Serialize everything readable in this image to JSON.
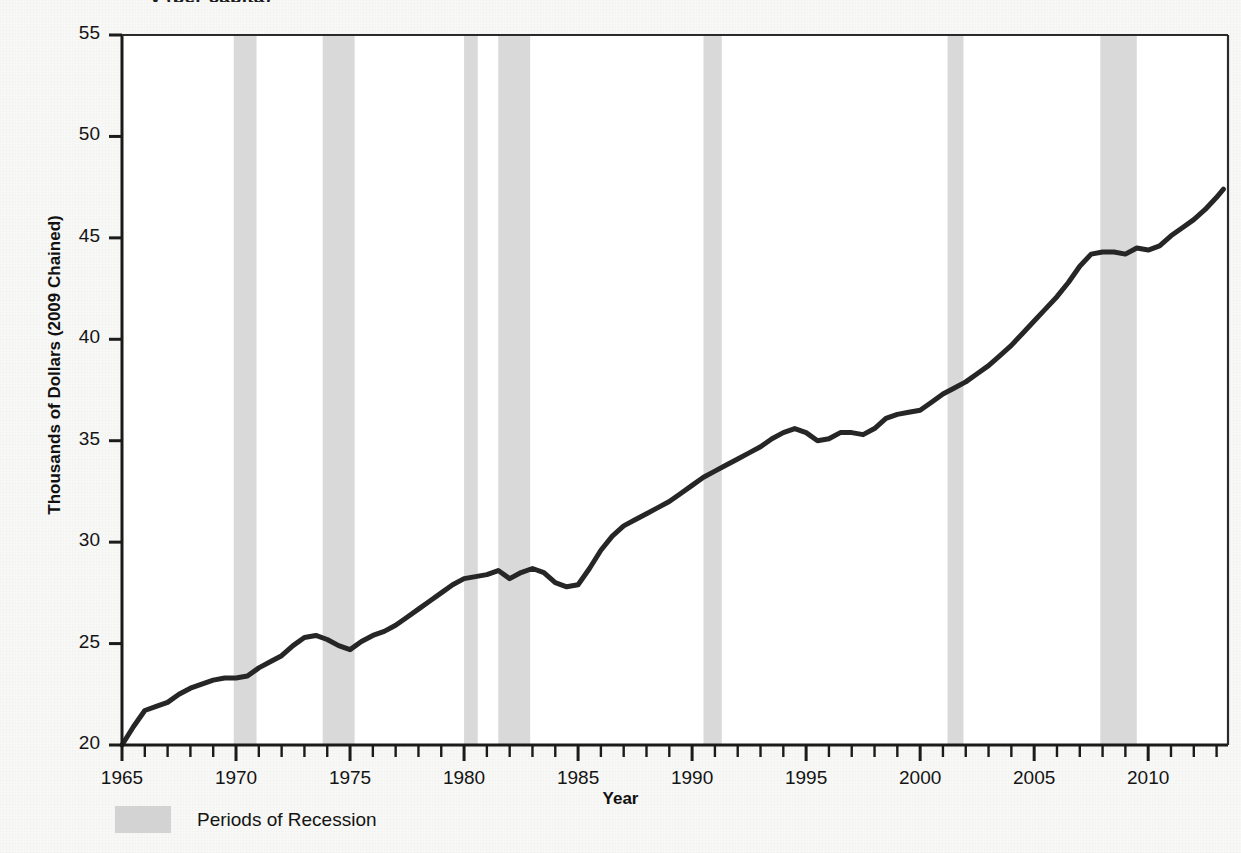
{
  "figure": {
    "title_partial": "y (per capita)",
    "background_color": "#f8f8f6",
    "plot_background_color": "#ffffff"
  },
  "axes": {
    "y_title": "Thousands of Dollars (2009 Chained)",
    "x_title": "Year",
    "y_ticks": [
      "20",
      "25",
      "30",
      "35",
      "40",
      "45",
      "50",
      "55"
    ],
    "x_ticks": [
      "1965",
      "1970",
      "1975",
      "1980",
      "1985",
      "1990",
      "1995",
      "2000",
      "2005",
      "2010"
    ]
  },
  "legend": {
    "swatch_color": "#d3d3d3",
    "label": "Periods of Recession"
  },
  "chart_data": {
    "type": "line",
    "xlabel": "Year",
    "ylabel": "Thousands of Dollars (2009 Chained)",
    "xlim": [
      1965,
      2013.5
    ],
    "ylim": [
      20,
      55
    ],
    "grid": false,
    "legend_position": "below-axis-left",
    "line_color": "#262626",
    "line_width_px": 5,
    "series": [
      {
        "name": "Real Disposable Income per Capita",
        "x": [
          1965.0,
          1965.5,
          1966.0,
          1966.5,
          1967.0,
          1967.5,
          1968.0,
          1968.5,
          1969.0,
          1969.5,
          1970.0,
          1970.5,
          1971.0,
          1971.5,
          1972.0,
          1972.5,
          1973.0,
          1973.5,
          1974.0,
          1974.5,
          1975.0,
          1975.5,
          1976.0,
          1976.5,
          1977.0,
          1977.5,
          1978.0,
          1978.5,
          1979.0,
          1979.5,
          1980.0,
          1980.5,
          1981.0,
          1981.5,
          1982.0,
          1982.5,
          1983.0,
          1983.5,
          1984.0,
          1984.5,
          1985.0,
          1985.5,
          1986.0,
          1986.5,
          1987.0,
          1987.5,
          1988.0,
          1988.5,
          1989.0,
          1989.5,
          1990.0,
          1990.5,
          1991.0,
          1991.5,
          1992.0,
          1992.5,
          1993.0,
          1993.5,
          1994.0,
          1994.5,
          1995.0,
          1995.5,
          1996.0,
          1996.5,
          1997.0,
          1997.5,
          1998.0,
          1998.5,
          1999.0,
          1999.5,
          2000.0,
          2000.5,
          2001.0,
          2001.5,
          2002.0,
          2002.5,
          2003.0,
          2003.5,
          2004.0,
          2004.5,
          2005.0,
          2005.5,
          2006.0,
          2006.5,
          2007.0,
          2007.5,
          2008.0,
          2008.5,
          2009.0,
          2009.5,
          2010.0,
          2010.5,
          2011.0,
          2011.5,
          2012.0,
          2012.5,
          2013.0,
          2013.3
        ],
        "y": [
          20.0,
          20.9,
          21.7,
          21.9,
          22.1,
          22.5,
          22.8,
          23.0,
          23.2,
          23.3,
          23.3,
          23.4,
          23.8,
          24.1,
          24.4,
          24.9,
          25.3,
          25.4,
          25.2,
          24.9,
          24.7,
          25.1,
          25.4,
          25.6,
          25.9,
          26.3,
          26.7,
          27.1,
          27.5,
          27.9,
          28.2,
          28.3,
          28.4,
          28.6,
          28.2,
          28.5,
          28.7,
          28.5,
          28.0,
          27.8,
          27.9,
          28.7,
          29.6,
          30.3,
          30.8,
          31.1,
          31.4,
          31.7,
          32.0,
          32.4,
          32.8,
          33.2,
          33.5,
          33.8,
          34.1,
          34.4,
          34.7,
          35.1,
          35.4,
          35.6,
          35.4,
          35.0,
          35.1,
          35.4,
          35.4,
          35.3,
          35.6,
          36.1,
          36.3,
          36.4,
          36.5,
          36.9,
          37.3,
          37.6,
          37.9,
          38.3,
          38.7,
          39.2,
          39.7,
          40.3,
          40.9,
          41.5,
          42.1,
          42.8,
          43.6,
          44.2,
          44.3,
          44.3,
          44.2,
          44.5,
          44.4,
          44.6,
          45.1,
          45.5,
          45.9,
          46.4,
          47.0,
          47.4
        ],
        "comment": "Values read from the axis; series rises from 20 in 1965 to ~49.7 in 2013 with dips in each recession"
      }
    ],
    "annotations": {
      "note": "Grey vertical bands mark NBER recession periods"
    },
    "recession_bands": [
      {
        "start": 1969.9,
        "end": 1970.9
      },
      {
        "start": 1973.8,
        "end": 1975.2
      },
      {
        "start": 1980.0,
        "end": 1980.6
      },
      {
        "start": 1981.5,
        "end": 1982.9
      },
      {
        "start": 1990.5,
        "end": 1991.3
      },
      {
        "start": 2001.2,
        "end": 2001.9
      },
      {
        "start": 2007.9,
        "end": 2009.5
      }
    ],
    "band_color": "#d9d9d9"
  }
}
